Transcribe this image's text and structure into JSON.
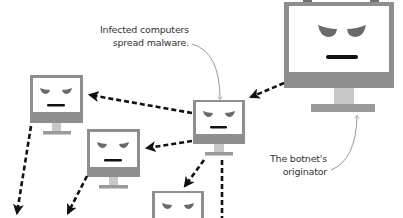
{
  "colors": {
    "frame": "#8e8e8e",
    "screen": "#ffffff",
    "neck": "#c8c8c8",
    "eye": "#6a6a6a",
    "mouth": "#111111",
    "arrow": "#111111",
    "callout": "#9a9a9a",
    "text": "#333333"
  },
  "annotations": {
    "infected": {
      "line1": "Infected computers",
      "line2": "spread malware."
    },
    "originator": {
      "line1": "The botnet's",
      "line2": "originator"
    }
  },
  "computers": [
    {
      "id": "originator",
      "role": "botnet originator",
      "x": 284,
      "y": 2,
      "w": 110,
      "h": 86
    },
    {
      "id": "infected-center",
      "role": "infected computer",
      "x": 193,
      "y": 100,
      "w": 52,
      "h": 52
    },
    {
      "id": "infected-left",
      "role": "infected computer",
      "x": 30,
      "y": 75,
      "w": 53,
      "h": 48
    },
    {
      "id": "infected-mid-left",
      "role": "infected computer",
      "x": 87,
      "y": 129,
      "w": 53,
      "h": 48
    },
    {
      "id": "infected-bottom",
      "role": "infected computer",
      "x": 152,
      "y": 191,
      "w": 52,
      "h": 52
    }
  ]
}
